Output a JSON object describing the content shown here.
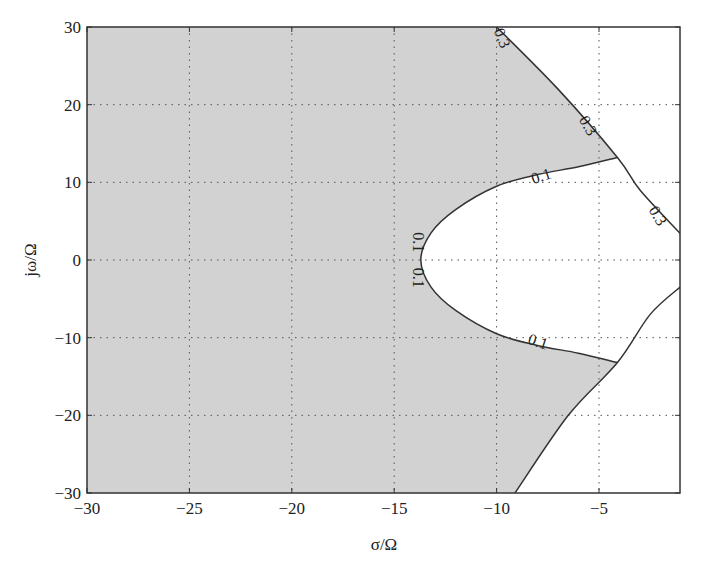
{
  "chart_data": {
    "type": "area",
    "title": "",
    "xlabel": "σ/Ω",
    "ylabel": "jω/Ω",
    "xlim": [
      -30,
      -1
    ],
    "ylim": [
      -30,
      30
    ],
    "grid": true,
    "legend": null,
    "x_ticks": [
      -30,
      -25,
      -20,
      -15,
      -10,
      -5
    ],
    "x_tick_labels": [
      "−30",
      "−25",
      "−20",
      "−15",
      "−10",
      "−5"
    ],
    "y_ticks": [
      30,
      20,
      10,
      0,
      -10,
      -20,
      -30
    ],
    "y_tick_labels": [
      "30",
      "20",
      "10",
      "0",
      "−10",
      "−20",
      "−30"
    ],
    "shaded_region": {
      "description": "Gray region bounded by damping contours 0.1 and 0.3",
      "color": "#d2d2d2"
    },
    "contours": [
      {
        "level": "0.1",
        "description": "Parabola-like curve opening right, vertex near σ=-13.7, ω=0",
        "points": [
          [
            -4.1,
            13.2
          ],
          [
            -6,
            12
          ],
          [
            -8,
            11
          ],
          [
            -10,
            9.5
          ],
          [
            -12,
            6.5
          ],
          [
            -13.2,
            3.5
          ],
          [
            -13.7,
            0
          ],
          [
            -13.2,
            -3.5
          ],
          [
            -12,
            -6.5
          ],
          [
            -10,
            -9.5
          ],
          [
            -8,
            -11
          ],
          [
            -6,
            -12
          ],
          [
            -4.1,
            -13.2
          ]
        ]
      },
      {
        "level": "0.3",
        "description": "Upper line from top edge to right edge",
        "points": [
          [
            -10,
            30
          ],
          [
            -7,
            22
          ],
          [
            -4.1,
            13.2
          ],
          [
            -3,
            9
          ],
          [
            -1,
            3.3
          ]
        ]
      },
      {
        "level": "0.3",
        "description": "Lower line from bottom edge to right edge (unlabeled)",
        "points": [
          [
            -9.1,
            -30
          ],
          [
            -6.5,
            -20
          ],
          [
            -4.1,
            -13.2
          ],
          [
            -2.5,
            -7
          ],
          [
            -1,
            -3.4
          ]
        ]
      }
    ],
    "contour_labels": [
      {
        "text": "0.3",
        "x": -9.8,
        "y": 28.5,
        "rotation": 68
      },
      {
        "text": "0.3",
        "x": -5.6,
        "y": 17.2,
        "rotation": 60
      },
      {
        "text": "0.3",
        "x": -2.2,
        "y": 5.6,
        "rotation": 60
      },
      {
        "text": "0.1",
        "x": -7.8,
        "y": 10.6,
        "rotation": -18
      },
      {
        "text": "0.1",
        "x": -13.9,
        "y": 2.3,
        "rotation": 90
      },
      {
        "text": "0.1",
        "x": -13.9,
        "y": -2.3,
        "rotation": 90
      },
      {
        "text": "0.1",
        "x": -8.0,
        "y": -10.7,
        "rotation": 18
      }
    ]
  }
}
